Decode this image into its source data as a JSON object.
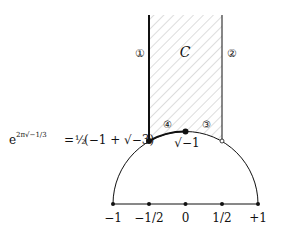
{
  "diagram": {
    "region_label": "C",
    "edge_labels": {
      "one": "①",
      "two": "②",
      "three": "③",
      "four": "④"
    },
    "point_labels": {
      "rho": "e^{2π√−1/3} = ½(−1 + √−3)",
      "rho_exp_base": "e",
      "rho_exp": "2π√−1/3",
      "rho_eq": "= ",
      "rho_half": "½",
      "rho_rest": "(−1 + √−3)",
      "i": "√−1"
    },
    "axis_ticks": [
      "−1",
      "−1/2",
      "0",
      "1/2",
      "+1"
    ],
    "colors": {
      "line": "#111111",
      "hatch": "#bbbbbb"
    }
  }
}
